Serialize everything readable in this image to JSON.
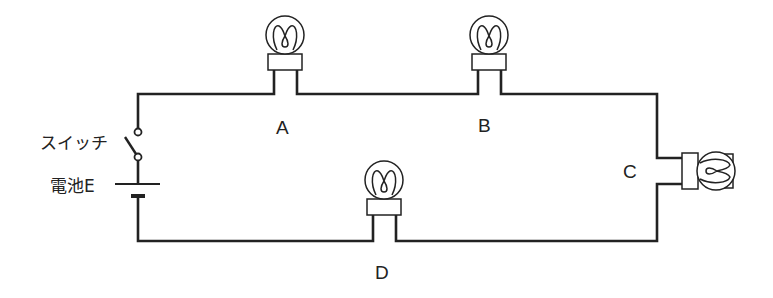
{
  "diagram": {
    "type": "circuit",
    "components": {
      "switch": {
        "label": "スイッチ"
      },
      "battery": {
        "label": "電池E"
      },
      "bulbs": [
        {
          "id": "A",
          "label": "A"
        },
        {
          "id": "B",
          "label": "B"
        },
        {
          "id": "C",
          "label": "C"
        },
        {
          "id": "D",
          "label": "D"
        }
      ]
    },
    "colors": {
      "wire": "#222222",
      "background": "#ffffff",
      "label": "#222222"
    }
  }
}
